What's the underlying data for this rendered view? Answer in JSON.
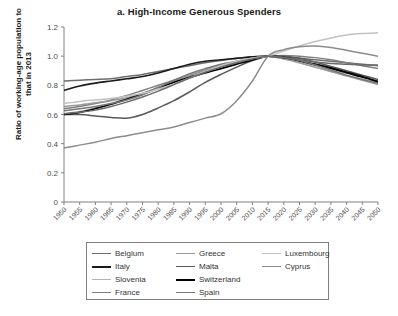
{
  "chart_data": {
    "type": "line",
    "title": "a. High-Income Generous Spenders",
    "xlabel": "",
    "ylabel": "Ratio of working-age population to that in 2013",
    "xlim": [
      1950,
      2050
    ],
    "ylim": [
      0,
      1.2
    ],
    "grid": false,
    "legend_position": "below",
    "x": [
      1950,
      1955,
      1960,
      1965,
      1970,
      1975,
      1980,
      1985,
      1990,
      1995,
      2000,
      2005,
      2010,
      2015,
      2020,
      2025,
      2030,
      2035,
      2040,
      2045,
      2050
    ],
    "xtick_labels": [
      "1950",
      "1955",
      "1960",
      "1965",
      "1970",
      "1975",
      "1980",
      "1985",
      "1990",
      "1995",
      "2000",
      "2005",
      "2010",
      "2015",
      "2020",
      "2025",
      "2030",
      "2035",
      "2040",
      "2045",
      "2050"
    ],
    "ytick_labels": [
      "0",
      "0.2",
      "0.4",
      "0.6",
      "0.8",
      "1.0",
      "1.2"
    ],
    "ytick_values": [
      0,
      0.2,
      0.4,
      0.6,
      0.8,
      1.0,
      1.2
    ],
    "series": [
      {
        "name": "Belgium",
        "color": "#6e6e6e",
        "width": 1.5,
        "values": [
          0.83,
          0.835,
          0.84,
          0.845,
          0.86,
          0.875,
          0.895,
          0.915,
          0.935,
          0.955,
          0.97,
          0.985,
          0.995,
          1.0,
          0.995,
          0.985,
          0.975,
          0.965,
          0.955,
          0.945,
          0.935
        ]
      },
      {
        "name": "Italy",
        "color": "#1a1a1a",
        "width": 1.6,
        "values": [
          0.765,
          0.795,
          0.815,
          0.83,
          0.845,
          0.86,
          0.885,
          0.915,
          0.945,
          0.965,
          0.975,
          0.985,
          0.995,
          1.0,
          0.985,
          0.965,
          0.94,
          0.915,
          0.885,
          0.855,
          0.82
        ]
      },
      {
        "name": "Slovenia",
        "color": "#b3b3b3",
        "width": 1.5,
        "values": [
          0.605,
          0.62,
          0.645,
          0.675,
          0.71,
          0.745,
          0.785,
          0.825,
          0.865,
          0.9,
          0.935,
          0.965,
          0.985,
          1.0,
          0.985,
          0.955,
          0.925,
          0.895,
          0.865,
          0.845,
          0.83
        ]
      },
      {
        "name": "France",
        "color": "#808080",
        "width": 1.5,
        "values": [
          0.64,
          0.655,
          0.675,
          0.7,
          0.73,
          0.765,
          0.8,
          0.835,
          0.87,
          0.905,
          0.935,
          0.96,
          0.985,
          1.0,
          1.005,
          1.0,
          0.99,
          0.975,
          0.955,
          0.935,
          0.915
        ]
      },
      {
        "name": "Greece",
        "color": "#999999",
        "width": 1.5,
        "values": [
          0.655,
          0.665,
          0.68,
          0.695,
          0.715,
          0.745,
          0.785,
          0.825,
          0.87,
          0.905,
          0.935,
          0.96,
          0.985,
          1.0,
          0.98,
          0.955,
          0.925,
          0.895,
          0.865,
          0.835,
          0.805
        ]
      },
      {
        "name": "Malta",
        "color": "#595959",
        "width": 1.5,
        "values": [
          0.6,
          0.6,
          0.59,
          0.58,
          0.575,
          0.6,
          0.645,
          0.695,
          0.755,
          0.82,
          0.875,
          0.925,
          0.97,
          1.0,
          1.0,
          0.985,
          0.96,
          0.93,
          0.9,
          0.87,
          0.84
        ]
      },
      {
        "name": "Switzerland",
        "color": "#000000",
        "width": 1.7,
        "values": [
          0.6,
          0.615,
          0.64,
          0.67,
          0.705,
          0.74,
          0.78,
          0.82,
          0.855,
          0.885,
          0.915,
          0.945,
          0.975,
          1.0,
          0.99,
          0.97,
          0.945,
          0.92,
          0.89,
          0.86,
          0.825
        ]
      },
      {
        "name": "Spain",
        "color": "#777777",
        "width": 1.5,
        "values": [
          0.625,
          0.64,
          0.655,
          0.675,
          0.7,
          0.735,
          0.785,
          0.835,
          0.88,
          0.915,
          0.945,
          0.965,
          0.985,
          1.0,
          0.99,
          0.97,
          0.94,
          0.905,
          0.87,
          0.84,
          0.815
        ]
      },
      {
        "name": "Luxembourg",
        "color": "#c2c2c2",
        "width": 1.5,
        "values": [
          0.675,
          0.69,
          0.7,
          0.71,
          0.725,
          0.745,
          0.775,
          0.81,
          0.85,
          0.895,
          0.935,
          0.965,
          0.985,
          1.0,
          1.035,
          1.07,
          1.1,
          1.125,
          1.145,
          1.155,
          1.16
        ]
      },
      {
        "name": "Cyprus",
        "color": "#8c8c8c",
        "width": 1.5,
        "values": [
          0.37,
          0.39,
          0.41,
          0.435,
          0.455,
          0.475,
          0.495,
          0.515,
          0.545,
          0.575,
          0.605,
          0.695,
          0.83,
          1.0,
          1.045,
          1.065,
          1.07,
          1.06,
          1.04,
          1.02,
          1.0
        ]
      },
      {
        "name": "Series-11",
        "color": "#6b6b6b",
        "width": 1.5,
        "values": [
          0.605,
          0.615,
          0.63,
          0.655,
          0.685,
          0.72,
          0.76,
          0.805,
          0.85,
          0.89,
          0.925,
          0.955,
          0.98,
          1.0,
          0.99,
          0.975,
          0.96,
          0.95,
          0.945,
          0.94,
          0.94
        ]
      }
    ]
  },
  "legend": {
    "entries": [
      {
        "label": "Belgium",
        "color": "#6e6e6e",
        "width": 1.6
      },
      {
        "label": "Greece",
        "color": "#999999",
        "width": 1.5
      },
      {
        "label": "Luxembourg",
        "color": "#c2c2c2",
        "width": 1.5
      },
      {
        "label": "Italy",
        "color": "#1a1a1a",
        "width": 2.0
      },
      {
        "label": "Malta",
        "color": "#595959",
        "width": 1.8
      },
      {
        "label": "Cyprus",
        "color": "#8c8c8c",
        "width": 1.5
      },
      {
        "label": "Slovenia",
        "color": "#b3b3b3",
        "width": 1.4
      },
      {
        "label": "Switzerland",
        "color": "#000000",
        "width": 2.2
      },
      {
        "label": "",
        "color": "#ffffff",
        "width": 0
      },
      {
        "label": "France",
        "color": "#808080",
        "width": 1.5
      },
      {
        "label": "Spain",
        "color": "#777777",
        "width": 1.6
      },
      {
        "label": "",
        "color": "#ffffff",
        "width": 0
      }
    ]
  },
  "axes": {
    "axis_color": "#808080",
    "tick_color": "#808080"
  }
}
